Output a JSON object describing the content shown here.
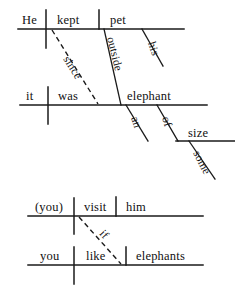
{
  "document": {
    "kind": "reed-kellogg-sentence-diagrams",
    "background_color": "#ffffff",
    "ink_color": "#1a1a1a"
  },
  "diagrams": [
    {
      "id": "diagram-1",
      "sentence": "He kept his pet elephant outside since it was an elephant of some size.",
      "words": {
        "subject": "He",
        "verb": "kept",
        "object": "pet",
        "modifier_his": "his",
        "adverbial": "outside",
        "conjunction": "since",
        "sub_subject": "it",
        "sub_verb": "was",
        "sub_complement": "elephant",
        "article_an": "an",
        "prep_of": "of",
        "prep_object": "size",
        "modifier_some": "some"
      }
    },
    {
      "id": "diagram-2",
      "sentence": "(You) visit him if you like elephants.",
      "words": {
        "subject": "(you)",
        "verb": "visit",
        "object": "him",
        "conjunction": "if",
        "sub_subject": "you",
        "sub_verb": "like",
        "sub_object": "elephants"
      }
    }
  ]
}
